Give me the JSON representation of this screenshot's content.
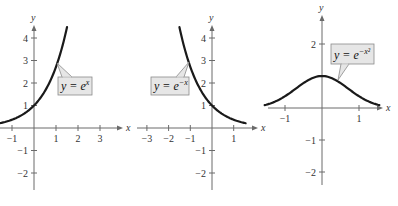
{
  "chart_data": [
    {
      "type": "line",
      "title": "",
      "function": "e^x",
      "equation_label": {
        "base": "y = e",
        "exponent": "x"
      },
      "xlabel": "x",
      "ylabel": "y",
      "xlim": [
        -1.5,
        3.5
      ],
      "ylim": [
        -2.5,
        4.6
      ],
      "x_ticks": [
        -1,
        1,
        2,
        3
      ],
      "y_ticks": [
        -2,
        -1,
        1,
        2,
        3,
        4
      ],
      "x": [
        -1.5,
        -1,
        -0.5,
        0,
        0.5,
        1,
        1.5
      ],
      "y": [
        0.22,
        0.37,
        0.61,
        1.0,
        1.65,
        2.72,
        4.48
      ],
      "grid": false
    },
    {
      "type": "line",
      "title": "",
      "function": "e^-x",
      "equation_label": {
        "base": "y = e",
        "exponent": "−x"
      },
      "xlabel": "x",
      "ylabel": "y",
      "xlim": [
        -3.5,
        1.5
      ],
      "ylim": [
        -2.5,
        4.6
      ],
      "x_ticks": [
        -3,
        -2,
        -1,
        1
      ],
      "y_ticks": [
        -2,
        -1,
        1,
        2,
        3,
        4
      ],
      "x": [
        -1.5,
        -1,
        -0.5,
        0,
        0.5,
        1,
        1.5
      ],
      "y": [
        4.48,
        2.72,
        1.65,
        1.0,
        0.61,
        0.37,
        0.22
      ],
      "grid": false
    },
    {
      "type": "line",
      "title": "",
      "function": "e^(-x^2)",
      "equation_label": {
        "base": "y = e",
        "exponent": "−x²"
      },
      "xlabel": "x",
      "ylabel": "y",
      "xlim": [
        -1.5,
        1.5
      ],
      "ylim": [
        -2.5,
        2.5
      ],
      "x_ticks": [
        -1,
        1
      ],
      "y_ticks": [
        -2,
        -1,
        2
      ],
      "x": [
        -1.5,
        -1,
        -0.5,
        0,
        0.5,
        1,
        1.5
      ],
      "y": [
        0.11,
        0.37,
        0.78,
        1.0,
        0.78,
        0.37,
        0.11
      ],
      "grid": false
    }
  ],
  "graphs": [
    {
      "name": "graph-exp",
      "origin": [
        34,
        128
      ],
      "sx": 22,
      "sy": 22.5,
      "xaxis": [
        0,
        118
      ],
      "yaxis": [
        30,
        190
      ],
      "x_ticks": [
        {
          "v": -1,
          "t": "−1"
        },
        {
          "v": 1,
          "t": "1"
        },
        {
          "v": 2,
          "t": "2"
        },
        {
          "v": 3,
          "t": "3"
        }
      ],
      "y_ticks": [
        {
          "v": 4,
          "t": "4"
        },
        {
          "v": 3,
          "t": "3"
        },
        {
          "v": 2,
          "t": "2"
        },
        {
          "v": 1,
          "t": "1"
        },
        {
          "v": -1,
          "t": "−1"
        },
        {
          "v": -2,
          "t": "−2"
        }
      ],
      "domain": [
        -1.55,
        1.5
      ],
      "fn": "exp",
      "callout": {
        "box": [
          58,
          77,
          34,
          18
        ],
        "tip": [
          57,
          63
        ],
        "base": [
          62,
          77,
          72,
          77
        ],
        "label": "y = e",
        "sup": "x"
      },
      "xlabel": "x",
      "ylabel": "y"
    },
    {
      "name": "graph-exp-neg",
      "origin": [
        212,
        128
      ],
      "sx": 21.7,
      "sy": 22.5,
      "xaxis": [
        137,
        253
      ],
      "yaxis": [
        30,
        190
      ],
      "x_ticks": [
        {
          "v": -3,
          "t": "−3"
        },
        {
          "v": -2,
          "t": "−2"
        },
        {
          "v": -1,
          "t": "−1"
        },
        {
          "v": 1,
          "t": "1"
        }
      ],
      "y_ticks": [
        {
          "v": 4,
          "t": "4"
        },
        {
          "v": 3,
          "t": "3"
        },
        {
          "v": 2,
          "t": "2"
        },
        {
          "v": 1,
          "t": "1"
        },
        {
          "v": -1,
          "t": "−1"
        },
        {
          "v": -2,
          "t": "−2"
        }
      ],
      "domain": [
        -1.5,
        1.55
      ],
      "fn": "expneg",
      "callout": {
        "box": [
          151,
          77,
          38,
          18
        ],
        "tip": [
          189,
          62
        ],
        "base": [
          176,
          77,
          184,
          77
        ],
        "label": "y = e",
        "sup": "−x"
      },
      "xlabel": "x",
      "ylabel": "y"
    },
    {
      "name": "graph-gauss",
      "origin": [
        322,
        108
      ],
      "sx": 37,
      "sy": 32,
      "xaxis": [
        268,
        378
      ],
      "yaxis": [
        20,
        185
      ],
      "x_ticks": [
        {
          "v": -1,
          "t": "−1"
        },
        {
          "v": 1,
          "t": "1"
        }
      ],
      "y_ticks": [
        {
          "v": 2,
          "t": "2"
        },
        {
          "v": -1,
          "t": "−1"
        },
        {
          "v": -2,
          "t": "−2"
        }
      ],
      "domain": [
        -1.55,
        1.55
      ],
      "fn": "gauss",
      "callout": {
        "box": [
          331,
          44,
          43,
          20
        ],
        "tip": [
          338,
          80
        ],
        "base": [
          341,
          64,
          349,
          64
        ],
        "label": "y = e",
        "sup": "−x²"
      },
      "xlabel": "x",
      "ylabel": "y"
    }
  ]
}
